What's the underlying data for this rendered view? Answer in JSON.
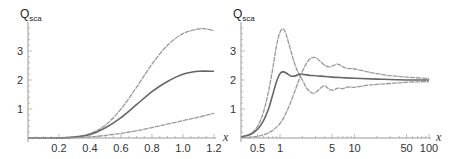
{
  "chart_data": [
    {
      "type": "line",
      "title": "",
      "ylabel": "Q",
      "ylabel_sub": "sca",
      "xlabel": "x",
      "xscale": "linear",
      "xlim": [
        0,
        1.2
      ],
      "ylim": [
        0,
        3.9
      ],
      "xticks": [
        0.2,
        0.4,
        0.6,
        0.8,
        1.0,
        1.2
      ],
      "xtick_labels": [
        "0.2",
        "0.4",
        "0.6",
        "0.8",
        "1.0",
        "1.2"
      ],
      "yticks": [
        1,
        2,
        3
      ],
      "ytick_labels": [
        "1",
        "2",
        "3"
      ],
      "grid": false,
      "series": [
        {
          "name": "upper",
          "color": "#9a9a9a",
          "x": [
            0,
            0.2,
            0.3,
            0.4,
            0.5,
            0.6,
            0.7,
            0.8,
            0.9,
            1.0,
            1.1,
            1.15,
            1.2
          ],
          "y": [
            0,
            0.005,
            0.04,
            0.15,
            0.45,
            1.0,
            1.75,
            2.55,
            3.2,
            3.6,
            3.76,
            3.76,
            3.7
          ]
        },
        {
          "name": "middle",
          "color": "#666666",
          "x": [
            0,
            0.2,
            0.3,
            0.4,
            0.5,
            0.6,
            0.7,
            0.8,
            0.9,
            1.0,
            1.1,
            1.2
          ],
          "y": [
            0,
            0.004,
            0.03,
            0.12,
            0.35,
            0.7,
            1.15,
            1.6,
            1.95,
            2.2,
            2.3,
            2.3
          ]
        },
        {
          "name": "lower",
          "color": "#9a9a9a",
          "x": [
            0,
            0.2,
            0.3,
            0.4,
            0.5,
            0.6,
            0.7,
            0.8,
            0.9,
            1.0,
            1.1,
            1.2
          ],
          "y": [
            0,
            0.002,
            0.01,
            0.04,
            0.09,
            0.16,
            0.25,
            0.36,
            0.48,
            0.6,
            0.72,
            0.85
          ]
        }
      ]
    },
    {
      "type": "line",
      "title": "",
      "ylabel": "Q",
      "ylabel_sub": "sca",
      "xlabel": "x",
      "xscale": "log",
      "xlim": [
        0.3,
        100
      ],
      "ylim": [
        0,
        3.9
      ],
      "xticks": [
        0.5,
        1,
        5,
        10,
        50,
        100
      ],
      "xtick_labels": [
        "0.5",
        "1",
        "5",
        "10",
        "50",
        "100"
      ],
      "yticks": [
        1,
        2,
        3
      ],
      "ytick_labels": [
        "1",
        "2",
        "3"
      ],
      "grid": false,
      "series": [
        {
          "name": "upper",
          "color": "#9a9a9a",
          "x": [
            0.3,
            0.4,
            0.5,
            0.6,
            0.7,
            0.8,
            0.9,
            1.0,
            1.1,
            1.2,
            1.4,
            1.6,
            1.8,
            2.0,
            2.3,
            2.7,
            3.0,
            3.5,
            4.0,
            4.6,
            5.2,
            6.0,
            7.0,
            8.0,
            10,
            15,
            20,
            30,
            50,
            100
          ],
          "y": [
            0.04,
            0.15,
            0.4,
            0.9,
            1.6,
            2.4,
            3.2,
            3.65,
            3.76,
            3.6,
            3.0,
            2.5,
            2.2,
            2.0,
            1.7,
            1.55,
            1.57,
            1.72,
            1.8,
            1.68,
            1.65,
            1.72,
            1.7,
            1.76,
            1.75,
            1.82,
            1.85,
            1.88,
            1.92,
            1.95
          ]
        },
        {
          "name": "middle",
          "color": "#666666",
          "x": [
            0.3,
            0.4,
            0.5,
            0.6,
            0.7,
            0.8,
            0.9,
            1.0,
            1.1,
            1.2,
            1.4,
            1.6,
            1.8,
            2.0,
            2.5,
            3.0,
            4.0,
            5.0,
            7.0,
            10,
            20,
            50,
            100
          ],
          "y": [
            0.03,
            0.12,
            0.3,
            0.6,
            1.0,
            1.5,
            1.95,
            2.22,
            2.28,
            2.25,
            2.14,
            2.14,
            2.2,
            2.2,
            2.16,
            2.15,
            2.12,
            2.1,
            2.08,
            2.06,
            2.03,
            2.0,
            2.0
          ]
        },
        {
          "name": "lower",
          "color": "#9a9a9a",
          "x": [
            0.3,
            0.4,
            0.5,
            0.6,
            0.7,
            0.8,
            1.0,
            1.2,
            1.4,
            1.6,
            1.8,
            2.0,
            2.3,
            2.6,
            2.9,
            3.3,
            3.8,
            4.5,
            5.2,
            6.0,
            7.0,
            8.0,
            10,
            15,
            20,
            30,
            50,
            100
          ],
          "y": [
            0.01,
            0.03,
            0.06,
            0.11,
            0.18,
            0.27,
            0.5,
            0.85,
            1.25,
            1.65,
            2.0,
            2.3,
            2.6,
            2.75,
            2.78,
            2.7,
            2.55,
            2.45,
            2.5,
            2.55,
            2.45,
            2.4,
            2.38,
            2.28,
            2.22,
            2.15,
            2.1,
            2.05
          ]
        }
      ]
    }
  ]
}
